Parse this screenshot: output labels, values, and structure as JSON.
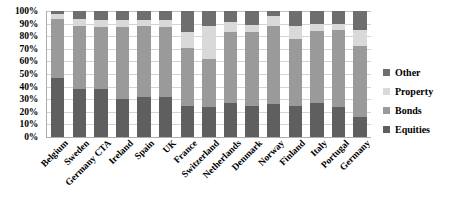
{
  "chart_data": {
    "type": "bar",
    "subtype": "stacked-bar-100-percent",
    "title": "",
    "xlabel": "",
    "ylabel": "",
    "ylim": [
      0,
      100
    ],
    "yticks": [
      "0%",
      "10%",
      "20%",
      "30%",
      "40%",
      "50%",
      "60%",
      "70%",
      "80%",
      "90%",
      "100%"
    ],
    "ytick_values": [
      0,
      10,
      20,
      30,
      40,
      50,
      60,
      70,
      80,
      90,
      100
    ],
    "grid": true,
    "legend_position": "right",
    "stack_order_bottom_to_top": [
      "Equities",
      "Bonds",
      "Property",
      "Other"
    ],
    "categories": [
      "Belgium",
      "Sweden",
      "Germany CTA",
      "Ireland",
      "Spain",
      "UK",
      "France",
      "Switzerland",
      "Netherlands",
      "Denmark",
      "Norway",
      "Finland",
      "Italy",
      "Portugal",
      "Germany"
    ],
    "series": [
      {
        "name": "Equities",
        "color": "#5f5f5f",
        "values": [
          47,
          38,
          38,
          30,
          32,
          32,
          25,
          24,
          27,
          25,
          26,
          25,
          27,
          24,
          16
        ]
      },
      {
        "name": "Bonds",
        "color": "#9a9a9a",
        "values": [
          47,
          50,
          49,
          57,
          56,
          55,
          46,
          38,
          56,
          58,
          62,
          53,
          57,
          61,
          56
        ]
      },
      {
        "name": "Property",
        "color": "#d9d9d9",
        "values": [
          4,
          6,
          6,
          6,
          5,
          6,
          12,
          26,
          8,
          6,
          8,
          10,
          6,
          5,
          13
        ]
      },
      {
        "name": "Other",
        "color": "#6e6e6e",
        "values": [
          2,
          6,
          7,
          7,
          7,
          7,
          17,
          12,
          9,
          11,
          4,
          12,
          10,
          10,
          15
        ]
      }
    ]
  },
  "legend": {
    "items": [
      {
        "label": "Other",
        "color": "#6e6e6e"
      },
      {
        "label": "Property",
        "color": "#d9d9d9"
      },
      {
        "label": "Bonds",
        "color": "#9a9a9a"
      },
      {
        "label": "Equities",
        "color": "#5f5f5f"
      }
    ]
  }
}
